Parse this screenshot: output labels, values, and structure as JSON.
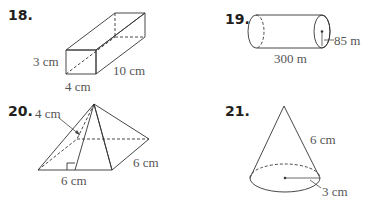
{
  "problems": [
    {
      "number": "18.",
      "shape": "rectangular-prism",
      "labels": {
        "height": "3 cm",
        "length": "10 cm",
        "width": "4 cm"
      }
    },
    {
      "number": "19.",
      "shape": "cylinder",
      "labels": {
        "radius": "85 m",
        "length": "300 m"
      }
    },
    {
      "number": "20.",
      "shape": "square-pyramid",
      "labels": {
        "slant_height": "4 cm",
        "base_front": "6 cm",
        "base_side": "6 cm"
      }
    },
    {
      "number": "21.",
      "shape": "cone",
      "labels": {
        "slant_height": "6 cm",
        "radius": "3 cm"
      }
    }
  ],
  "colors": {
    "fill_light": "#ececec",
    "fill_mid": "#d9d9d9",
    "fill_dark": "#c8c8c8",
    "stroke": "#333333",
    "label_text": "#555555",
    "number_text": "#231f20"
  }
}
